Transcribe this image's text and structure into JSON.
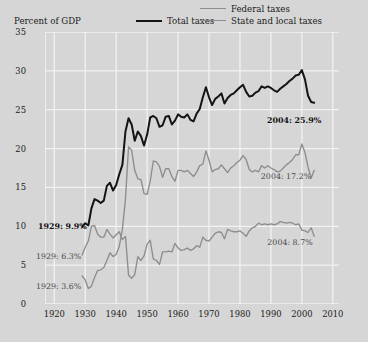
{
  "chart_data": {
    "type": "line",
    "title": "",
    "ylabel": "Percent of GDP",
    "xlabel": "",
    "xlim": [
      1917,
      2012
    ],
    "ylim": [
      0,
      35
    ],
    "yticks": [
      0,
      5,
      10,
      15,
      20,
      25,
      30,
      35
    ],
    "xticks": [
      1920,
      1930,
      1940,
      1950,
      1960,
      1970,
      1980,
      1990,
      2000,
      2010
    ],
    "grid": true,
    "legend_position": "top-right",
    "colors": {
      "total": "#141414",
      "federal": "#8d8d8d",
      "state_local": "#8d8d8d",
      "background": "#d6d6d6",
      "gridline": "#f2f2f2"
    },
    "series": [
      {
        "name": "Total taxes",
        "color": "#141414",
        "x": [
          1929,
          1930,
          1931,
          1932,
          1933,
          1934,
          1935,
          1936,
          1937,
          1938,
          1939,
          1940,
          1941,
          1942,
          1943,
          1944,
          1945,
          1946,
          1947,
          1948,
          1949,
          1950,
          1951,
          1952,
          1953,
          1954,
          1955,
          1956,
          1957,
          1958,
          1959,
          1960,
          1961,
          1962,
          1963,
          1964,
          1965,
          1966,
          1967,
          1968,
          1969,
          1970,
          1971,
          1972,
          1973,
          1974,
          1975,
          1976,
          1977,
          1978,
          1979,
          1980,
          1981,
          1982,
          1983,
          1984,
          1985,
          1986,
          1987,
          1988,
          1989,
          1990,
          1991,
          1992,
          1993,
          1994,
          1995,
          1996,
          1997,
          1998,
          1999,
          2000,
          2001,
          2002,
          2003,
          2004
        ],
        "y": [
          9.9,
          10.4,
          10.1,
          12.3,
          13.5,
          13.3,
          13.0,
          13.3,
          15.2,
          15.6,
          14.6,
          15.3,
          16.7,
          17.9,
          22.2,
          23.9,
          23.1,
          21.0,
          22.2,
          21.6,
          20.4,
          21.8,
          24.0,
          24.2,
          23.9,
          22.8,
          23.0,
          24.1,
          24.2,
          23.1,
          23.6,
          24.4,
          24.1,
          24.0,
          24.4,
          23.7,
          23.5,
          24.5,
          25.1,
          26.6,
          27.9,
          26.6,
          25.6,
          26.4,
          26.7,
          27.1,
          25.8,
          26.5,
          26.9,
          27.1,
          27.5,
          27.9,
          28.2,
          27.3,
          26.7,
          26.8,
          27.2,
          27.4,
          28.0,
          27.8,
          28.0,
          27.8,
          27.5,
          27.3,
          27.7,
          28.0,
          28.3,
          28.7,
          29.0,
          29.4,
          29.5,
          30.1,
          28.9,
          26.8,
          26.0,
          25.9
        ],
        "endpoint_label": "2004: 25.9%",
        "start_label": "1929: 9.9%"
      },
      {
        "name": "Federal taxes",
        "color": "#8d8d8d",
        "x": [
          1929,
          1930,
          1931,
          1932,
          1933,
          1934,
          1935,
          1936,
          1937,
          1938,
          1939,
          1940,
          1941,
          1942,
          1943,
          1944,
          1945,
          1946,
          1947,
          1948,
          1949,
          1950,
          1951,
          1952,
          1953,
          1954,
          1955,
          1956,
          1957,
          1958,
          1959,
          1960,
          1961,
          1962,
          1963,
          1964,
          1965,
          1966,
          1967,
          1968,
          1969,
          1970,
          1971,
          1972,
          1973,
          1974,
          1975,
          1976,
          1977,
          1978,
          1979,
          1980,
          1981,
          1982,
          1983,
          1984,
          1985,
          1986,
          1987,
          1988,
          1989,
          1990,
          1991,
          1992,
          1993,
          1994,
          1995,
          1996,
          1997,
          1998,
          1999,
          2000,
          2001,
          2002,
          2003,
          2004
        ],
        "y": [
          3.6,
          3.1,
          2.0,
          2.3,
          3.4,
          4.3,
          4.4,
          4.7,
          5.6,
          6.6,
          6.1,
          6.4,
          7.4,
          9.6,
          13.5,
          20.2,
          19.8,
          17.2,
          16.1,
          16.0,
          14.2,
          14.1,
          15.8,
          18.4,
          18.3,
          17.7,
          16.3,
          17.4,
          17.4,
          16.4,
          15.8,
          17.2,
          17.2,
          17.0,
          17.2,
          16.8,
          16.4,
          17.0,
          17.8,
          18.0,
          19.7,
          18.5,
          17.0,
          17.3,
          17.4,
          17.9,
          17.4,
          16.9,
          17.5,
          17.8,
          18.2,
          18.5,
          19.1,
          18.6,
          17.3,
          17.0,
          17.2,
          17.0,
          17.8,
          17.5,
          17.8,
          17.5,
          17.3,
          17.0,
          17.1,
          17.5,
          17.9,
          18.2,
          18.6,
          19.2,
          19.2,
          20.6,
          19.5,
          17.6,
          16.2,
          17.2
        ],
        "endpoint_label": "2004: 17.2%",
        "start_label": "1929: 3.6%"
      },
      {
        "name": "State and local taxes",
        "color": "#8d8d8d",
        "x": [
          1929,
          1930,
          1931,
          1932,
          1933,
          1934,
          1935,
          1936,
          1937,
          1938,
          1939,
          1940,
          1941,
          1942,
          1943,
          1944,
          1945,
          1946,
          1947,
          1948,
          1949,
          1950,
          1951,
          1952,
          1953,
          1954,
          1955,
          1956,
          1957,
          1958,
          1959,
          1960,
          1961,
          1962,
          1963,
          1964,
          1965,
          1966,
          1967,
          1968,
          1969,
          1970,
          1971,
          1972,
          1973,
          1974,
          1975,
          1976,
          1977,
          1978,
          1979,
          1980,
          1981,
          1982,
          1983,
          1984,
          1985,
          1986,
          1987,
          1988,
          1989,
          1990,
          1991,
          1992,
          1993,
          1994,
          1995,
          1996,
          1997,
          1998,
          1999,
          2000,
          2001,
          2002,
          2003,
          2004
        ],
        "y": [
          6.3,
          7.3,
          8.1,
          10.0,
          10.1,
          9.0,
          8.6,
          8.6,
          9.6,
          9.0,
          8.5,
          8.9,
          9.3,
          8.3,
          8.7,
          3.7,
          3.3,
          3.8,
          6.1,
          5.6,
          6.2,
          7.7,
          8.2,
          5.8,
          5.6,
          5.1,
          6.7,
          6.7,
          6.8,
          6.7,
          7.8,
          7.2,
          6.9,
          7.0,
          7.2,
          6.9,
          7.1,
          7.5,
          7.3,
          8.6,
          8.2,
          8.1,
          8.6,
          9.1,
          9.3,
          9.2,
          8.4,
          9.6,
          9.4,
          9.3,
          9.3,
          9.4,
          9.1,
          8.7,
          9.4,
          9.8,
          10.0,
          10.4,
          10.2,
          10.3,
          10.2,
          10.3,
          10.2,
          10.3,
          10.6,
          10.5,
          10.4,
          10.5,
          10.4,
          10.2,
          10.3,
          9.5,
          9.4,
          9.2,
          9.8,
          8.7
        ],
        "endpoint_label": "2004: 8.7%",
        "start_label": "1929: 6.3%"
      }
    ],
    "annotations": [
      {
        "text": "1929: 9.9%",
        "bold": true,
        "series": "Total taxes"
      },
      {
        "text": "1929: 6.3%",
        "bold": false,
        "series": "State and local taxes"
      },
      {
        "text": "1929: 3.6%",
        "bold": false,
        "series": "Federal taxes"
      },
      {
        "text": "2004: 25.9%",
        "bold": true,
        "series": "Total taxes"
      },
      {
        "text": "2004: 17.2%",
        "bold": false,
        "series": "Federal taxes"
      },
      {
        "text": "2004: 8.7%",
        "bold": false,
        "series": "State and local taxes"
      }
    ]
  },
  "legend": {
    "federal": "Federal taxes",
    "total": "Total taxes",
    "state_local": "State and local taxes"
  },
  "axes": {
    "ylabel": "Percent of GDP",
    "yticks": [
      "35",
      "30",
      "25",
      "20",
      "15",
      "10",
      "5",
      "0"
    ],
    "xticks": [
      "1920",
      "1930",
      "1940",
      "1950",
      "1960",
      "1970",
      "1980",
      "1990",
      "2000",
      "2010"
    ]
  },
  "annotations": {
    "a1929_total": "1929: 9.9%",
    "a1929_state": "1929: 6.3%",
    "a1929_federal": "1929: 3.6%",
    "a2004_total": "2004: 25.9%",
    "a2004_federal": "2004: 17.2%",
    "a2004_state": "2004: 8.7%"
  },
  "source": ""
}
